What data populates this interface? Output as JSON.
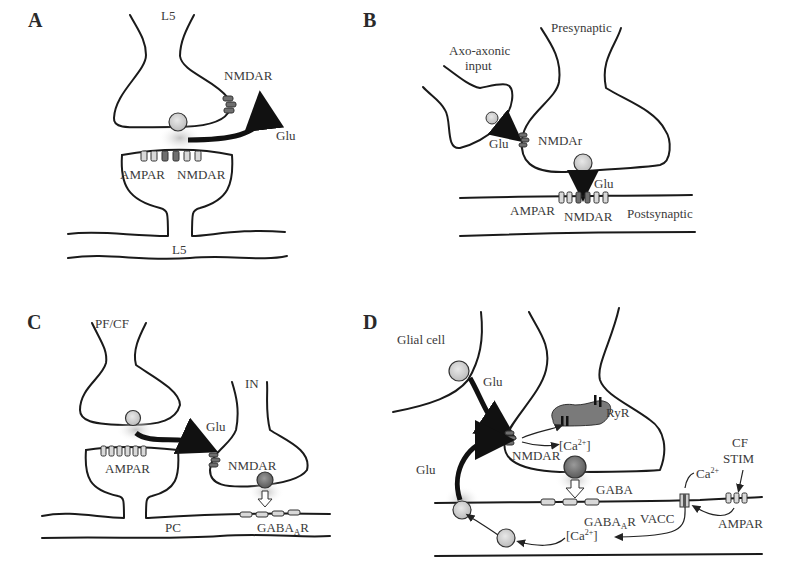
{
  "figure": {
    "panels": [
      {
        "id": "A",
        "label": "A",
        "labels": {
          "top_cell": "L5",
          "bottom_cell": "L5",
          "presyn_receptor": "NMDAR",
          "transmitter": "Glu",
          "post_receptor_1": "AMPAR",
          "post_receptor_2": "NMDAR"
        }
      },
      {
        "id": "B",
        "label": "B",
        "labels": {
          "axo_line1": "Axo-axonic",
          "axo_line2": "input",
          "presynaptic": "Presynaptic",
          "axo_transmitter": "Glu",
          "presyn_receptor": "NMDAr",
          "transmitter": "Glu",
          "post_receptor_1": "AMPAR",
          "post_receptor_2": "NMDAR",
          "postsynaptic": "Postsynaptic"
        }
      },
      {
        "id": "C",
        "label": "C",
        "labels": {
          "input_fiber": "PF/CF",
          "interneuron": "IN",
          "transmitter": "Glu",
          "post_receptor": "AMPAR",
          "presyn_receptor": "NMDAR",
          "target_cell": "PC",
          "gaba_receptor_base": "GABA",
          "gaba_receptor_sub": "A",
          "gaba_receptor_suffix": "R"
        }
      },
      {
        "id": "D",
        "label": "D",
        "labels": {
          "glial_cell": "Glial cell",
          "glu_top": "Glu",
          "glu_left": "Glu",
          "ryr": "RyR",
          "ca_inner_open": "[Ca",
          "ca_inner_sup": "2+",
          "ca_inner_close": "]",
          "presyn_receptor": "NMDAR",
          "gaba": "GABA",
          "gaba_receptor_base": "GABA",
          "gaba_receptor_sub": "A",
          "gaba_receptor_suffix": "R",
          "vacc": "VACC",
          "ca_channel_base": "Ca",
          "ca_channel_sup": "2+",
          "ca_post_open": "[Ca",
          "ca_post_sup": "2+",
          "ca_post_close": "]",
          "cf_line1": "CF",
          "cf_line2": "STIM",
          "ampar": "AMPAR"
        }
      }
    ],
    "colors": {
      "membrane": "#1a1a1a",
      "receptor_light": "#d9d9d9",
      "receptor_dark": "#6f6f6f",
      "vesicle_light": "#d0d0d0",
      "vesicle_dark": "#7a7a7a",
      "ryr_store": "#777777"
    }
  }
}
